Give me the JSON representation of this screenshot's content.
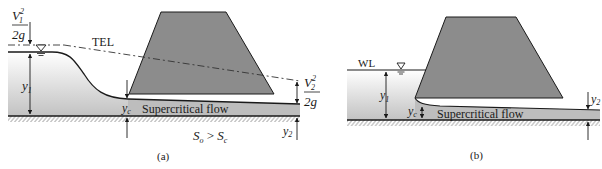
{
  "figure": {
    "panels": [
      {
        "id": "a",
        "caption": "(a)",
        "labels": {
          "v1_num": "V",
          "v1_sub": "1",
          "v1_sup": "2",
          "v1_den": "2g",
          "tel": "TEL",
          "y1": "y",
          "y1_sub": "1",
          "yc": "y",
          "yc_sub": "c",
          "flow": "Supercritical flow",
          "v2_num": "V",
          "v2_sub": "2",
          "v2_sup": "2",
          "v2_den": "2g",
          "y2": "y",
          "y2_sub": "2",
          "slope_so": "S",
          "slope_so_sub": "o",
          "slope_gt": " > ",
          "slope_sc": "S",
          "slope_sc_sub": "c"
        }
      },
      {
        "id": "b",
        "caption": "(b)",
        "labels": {
          "wl": "WL",
          "y1": "y",
          "y1_sub": "1",
          "yc": "y",
          "yc_sub": "c",
          "flow": "Supercritical flow",
          "y2": "y",
          "y2_sub": "2"
        }
      }
    ],
    "colors": {
      "gate": "#8c8c8c",
      "water_top": "#ffffff",
      "water_bottom": "#c4c4c4",
      "flow_band": "#bdbdbd",
      "line": "#1a1a1a"
    }
  }
}
